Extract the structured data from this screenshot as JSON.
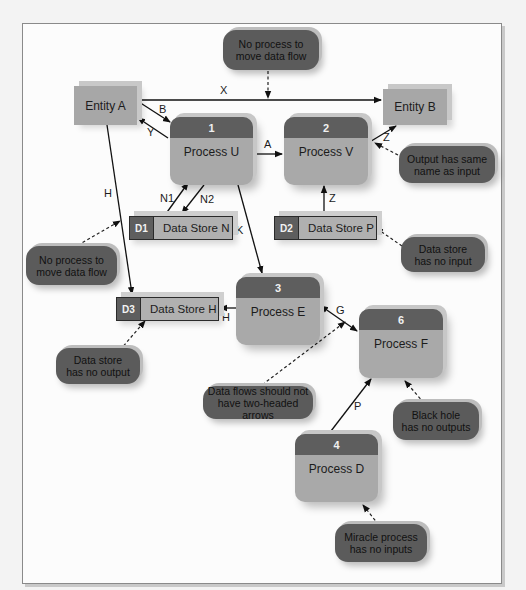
{
  "diagram": {
    "entities": [
      {
        "id": "entity-a",
        "label": "Entity A"
      },
      {
        "id": "entity-b",
        "label": "Entity B"
      }
    ],
    "processes": [
      {
        "id": "process-u",
        "number": "1",
        "label": "Process U"
      },
      {
        "id": "process-v",
        "number": "2",
        "label": "Process V"
      },
      {
        "id": "process-e",
        "number": "3",
        "label": "Process E"
      },
      {
        "id": "process-f",
        "number": "6",
        "label": "Process F"
      },
      {
        "id": "process-d",
        "number": "4",
        "label": "Process D"
      }
    ],
    "data_stores": [
      {
        "id": "data-store-n",
        "code": "D1",
        "label": "Data Store N"
      },
      {
        "id": "data-store-p",
        "code": "D2",
        "label": "Data Store P"
      },
      {
        "id": "data-store-h",
        "code": "D3",
        "label": "Data Store H"
      }
    ],
    "flows": [
      {
        "label": "X",
        "from": "Entity A",
        "to": "Entity B"
      },
      {
        "label": "B",
        "from": "Entity A",
        "to": "Process U"
      },
      {
        "label": "Y",
        "from": "Process U",
        "to": "Entity A"
      },
      {
        "label": "A",
        "from": "Process U",
        "to": "Process V"
      },
      {
        "label": "Z",
        "from": "Process V",
        "to": "Entity B"
      },
      {
        "label": "Z",
        "from": "Data Store P",
        "to": "Process V"
      },
      {
        "label": "N1",
        "from": "Data Store N",
        "to": "Process U"
      },
      {
        "label": "N2",
        "from": "Process U",
        "to": "Data Store N"
      },
      {
        "label": "K",
        "from": "Process U",
        "to": "Process E"
      },
      {
        "label": "H",
        "from": "Entity A",
        "to": "Data Store H"
      },
      {
        "label": "H",
        "from": "Process E",
        "to": "Data Store H"
      },
      {
        "label": "G",
        "from": "Process E",
        "to": "Process F",
        "two_headed": true
      },
      {
        "label": "P",
        "from": "Process D",
        "to": "Process F"
      }
    ],
    "callouts": [
      {
        "id": "callout-top",
        "text_line1": "No process to",
        "text_line2": "move data flow"
      },
      {
        "id": "callout-left",
        "text_line1": "No process to",
        "text_line2": "move data flow"
      },
      {
        "id": "callout-output",
        "text_line1": "Output has same",
        "text_line2": "name as input"
      },
      {
        "id": "callout-no-input",
        "text_line1": "Data store",
        "text_line2": "has no input"
      },
      {
        "id": "callout-no-output",
        "text_line1": "Data store",
        "text_line2": "has no output"
      },
      {
        "id": "callout-two-headed",
        "text_line1": "Data flows should not",
        "text_line2": "have two-headed arrows"
      },
      {
        "id": "callout-black-hole",
        "text_line1": "Black hole",
        "text_line2": "has no outputs"
      },
      {
        "id": "callout-miracle",
        "text_line1": "Miracle process",
        "text_line2": "has no inputs"
      }
    ]
  },
  "colors": {
    "entity_fill": "#a7a7a7",
    "process_body": "#a9a9a9",
    "process_header": "#5e5e5e",
    "callout_fill": "#5b5b5b",
    "line": "#111111"
  }
}
